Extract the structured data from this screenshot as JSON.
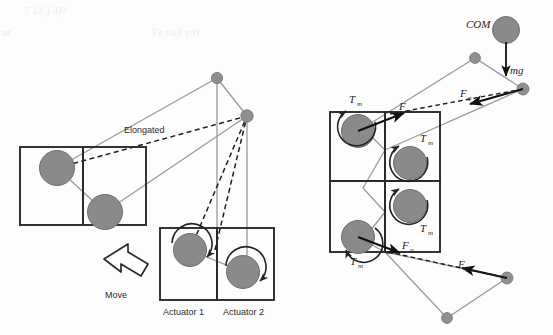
{
  "figure": {
    "name": "actuator-module-force-diagram",
    "background_color": "#fdfdfd",
    "width": 553,
    "height": 335
  },
  "palette": {
    "circle_fill": "#8a8a8a",
    "circle_stroke": "#6f6f6f",
    "box_stroke": "#2b2b2b",
    "strut_gray": "#9a9a9a",
    "node_fill": "#8f8f8f",
    "dashed_black": "#1f1f1f",
    "arrow_black": "#101010",
    "ghost_text": "#eceaea"
  },
  "left_panel": {
    "name": "elongated-state-panel",
    "labels": {
      "elongated": "Elongated",
      "move": "Move",
      "actuator_1": "Actuator 1",
      "actuator_2": "Actuator 2"
    },
    "modules": [
      {
        "name": "upper-left-module",
        "cells": 2
      },
      {
        "name": "lower-right-module",
        "cells": 2
      }
    ],
    "move_arrow_direction": "up-left"
  },
  "right_panel": {
    "name": "force-torque-panel",
    "labels": {
      "com": "COM",
      "gravity": "mg",
      "torque_1": "T",
      "torque_1_sub": "m",
      "torque_2": "T",
      "torque_2_sub": "m",
      "torque_3": "T",
      "torque_3_sub": "m",
      "torque_4": "T",
      "torque_4_sub": "m",
      "force_m": "F",
      "force_m_sub": "m",
      "force_g_upper": "F",
      "force_g_upper_sub": "g",
      "force_g_mid": "F",
      "force_g_mid_sub": "g",
      "force_g_lower": "F",
      "force_g_lower_sub": "g"
    },
    "module_grid": {
      "rows": 2,
      "cols": 2
    }
  },
  "scan_artifacts": {
    "name": "bleed-through-ghost-text",
    "lines": [
      "7 12 ) 3)?",
      "nt",
      "Fe   ni(f  y4)"
    ]
  }
}
